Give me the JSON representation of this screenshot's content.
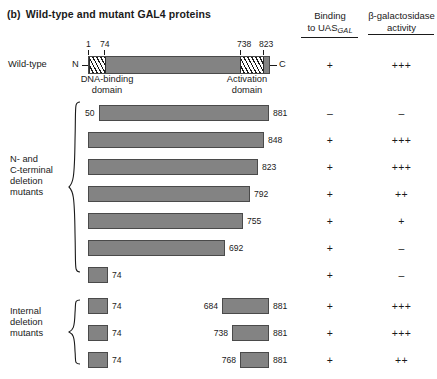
{
  "figure": {
    "panel_label": "(b)",
    "title": "Wild-type and mutant GAL4 proteins"
  },
  "columns": {
    "binding": {
      "line1": "Binding",
      "line2_pre": "to UAS",
      "line2_sub": "GAL"
    },
    "galactosidase": {
      "line1": "β-galactosidase",
      "line2": "activity"
    }
  },
  "wild_type": {
    "label": "Wild-type",
    "n_terminus": "N",
    "c_terminus": "C",
    "residue_marks": [
      "1",
      "74",
      "738",
      "823"
    ],
    "dna_binding_domain": {
      "line1": "DNA-binding",
      "line2": "domain"
    },
    "activation_domain": {
      "line1": "Activation",
      "line2": "domain"
    },
    "binding": "+",
    "activity": "+++"
  },
  "group_terminal": {
    "label_lines": [
      "N- and",
      "C-terminal",
      "deletion",
      "mutants"
    ],
    "rows": [
      {
        "start": "50",
        "end": "881",
        "binding": "–",
        "activity": "–"
      },
      {
        "start": "",
        "end": "848",
        "binding": "+",
        "activity": "+++"
      },
      {
        "start": "",
        "end": "823",
        "binding": "+",
        "activity": "+++"
      },
      {
        "start": "",
        "end": "792",
        "binding": "+",
        "activity": "++"
      },
      {
        "start": "",
        "end": "755",
        "binding": "+",
        "activity": "+"
      },
      {
        "start": "",
        "end": "692",
        "binding": "+",
        "activity": "–"
      },
      {
        "start": "",
        "end": "74",
        "binding": "+",
        "activity": "–"
      }
    ]
  },
  "group_internal": {
    "label_lines": [
      "Internal",
      "deletion",
      "mutants"
    ],
    "rows": [
      {
        "left_end": "74",
        "right_start": "684",
        "right_end": "881",
        "binding": "+",
        "activity": "+++"
      },
      {
        "left_end": "74",
        "right_start": "738",
        "right_end": "881",
        "binding": "+",
        "activity": "+++"
      },
      {
        "left_end": "74",
        "right_start": "768",
        "right_end": "881",
        "binding": "+",
        "activity": "++"
      }
    ]
  },
  "colors": {
    "bar_fill": "#838383",
    "bar_stroke": "#4a4a4a",
    "text": "#1a1a1a",
    "background": "#ffffff"
  }
}
